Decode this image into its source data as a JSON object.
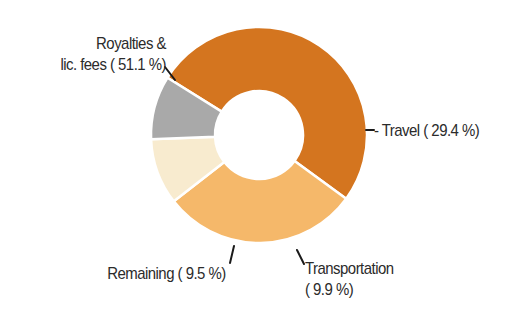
{
  "chart_data": {
    "type": "pie",
    "variant": "donut",
    "title": "",
    "categories": [
      "Royalties & lic. fees",
      "Travel",
      "Transportation",
      "Remaining"
    ],
    "values": [
      51.1,
      29.4,
      9.9,
      9.5
    ],
    "unit": "%",
    "colors": [
      "#d4751f",
      "#f5b86a",
      "#f8ebcf",
      "#a9a9a9"
    ],
    "labels": [
      {
        "line1": "Royalties &",
        "line2": "lic. fees ( 51.1 %)"
      },
      {
        "line1": "- Travel ( 29.4 %)"
      },
      {
        "line1": "Transportation",
        "line2": "( 9.9 %)"
      },
      {
        "line1": "Remaining ( 9.5 %)"
      }
    ],
    "legend": "none",
    "start_angle_deg": -148,
    "direction": "clockwise",
    "center": [
      259,
      135
    ],
    "outer_radius": 108,
    "inner_radius": 44
  }
}
